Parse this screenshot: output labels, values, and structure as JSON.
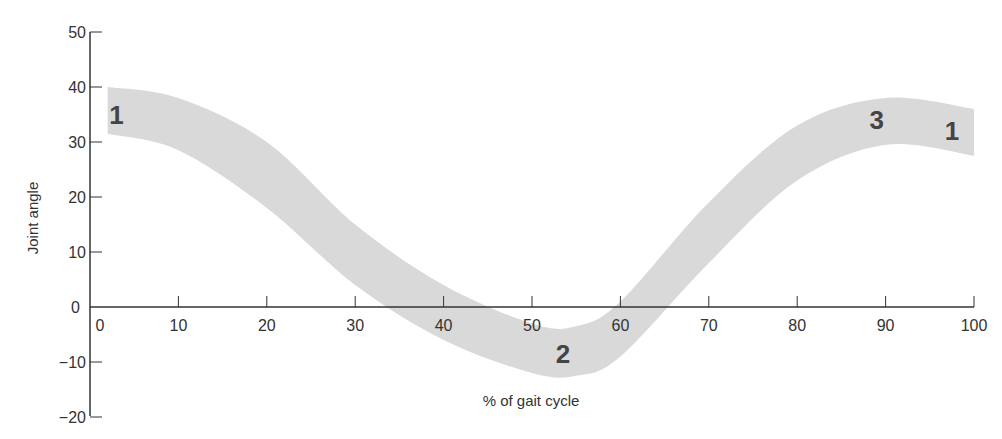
{
  "chart_data": {
    "type": "area",
    "title": "",
    "xlabel": "% of gait cycle",
    "ylabel": "Joint angle",
    "xlim": [
      0,
      100
    ],
    "ylim": [
      -20,
      50
    ],
    "x_ticks": [
      "0",
      "10",
      "20",
      "30",
      "40",
      "50",
      "60",
      "70",
      "80",
      "90",
      "100"
    ],
    "y_ticks": [
      "50",
      "40",
      "30",
      "20",
      "10",
      "0",
      "−10",
      "−20"
    ],
    "grid": false,
    "legend": null,
    "series": [
      {
        "name": "joint angle band (upper)",
        "x": [
          2,
          10,
          20,
          30,
          40,
          50,
          55,
          60,
          70,
          80,
          90,
          100
        ],
        "values": [
          40,
          38,
          30,
          15,
          4,
          -3,
          -3.5,
          1,
          19,
          33,
          38,
          36
        ]
      },
      {
        "name": "joint angle band (lower)",
        "x": [
          2,
          10,
          20,
          30,
          40,
          50,
          55,
          60,
          70,
          80,
          90,
          100
        ],
        "values": [
          31.5,
          28.5,
          18,
          4,
          -6,
          -12,
          -12.5,
          -9,
          8,
          23,
          29.5,
          27.5
        ]
      }
    ],
    "annotations": [
      {
        "text": "1",
        "x": 3,
        "y": 35
      },
      {
        "text": "2",
        "x": 53.5,
        "y": -8.5
      },
      {
        "text": "3",
        "x": 89,
        "y": 34
      },
      {
        "text": "1",
        "x": 97.5,
        "y": 32
      }
    ],
    "band_color": "#d9d9d9"
  }
}
